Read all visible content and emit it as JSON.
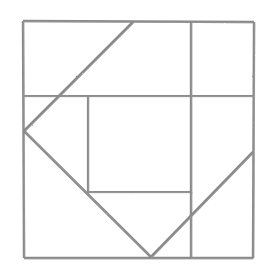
{
  "figure": {
    "medium": "pencil sketch",
    "canvas": {
      "width": 266,
      "height": 273,
      "background_color": "#ffffff"
    },
    "style": {
      "stroke_color": "#8a8a8a",
      "stroke_color_light": "#9d9d9d",
      "stroke_width": 2.4,
      "stroke_width_thin": 2.0
    },
    "elements": [
      {
        "name": "outer-frame-top-edge",
        "kind": "segment",
        "x1": 23,
        "y1": 21,
        "x2": 254,
        "y2": 22,
        "width": 2.4,
        "color": "#8a8a8a"
      },
      {
        "name": "outer-frame-right-edge",
        "kind": "segment",
        "x1": 254,
        "y1": 22,
        "x2": 253,
        "y2": 258,
        "width": 2.4,
        "color": "#8a8a8a"
      },
      {
        "name": "outer-frame-bottom-edge",
        "kind": "segment",
        "x1": 253,
        "y1": 258,
        "x2": 24,
        "y2": 258,
        "width": 2.4,
        "color": "#8a8a8a"
      },
      {
        "name": "outer-frame-left-edge",
        "kind": "segment",
        "x1": 24,
        "y1": 258,
        "x2": 23,
        "y2": 21,
        "width": 2.4,
        "color": "#8a8a8a"
      },
      {
        "name": "upper-horizontal-divider",
        "kind": "segment",
        "x1": 23,
        "y1": 96,
        "x2": 254,
        "y2": 96,
        "width": 2.2,
        "color": "#8d8d8d"
      },
      {
        "name": "inner-square-bottom-edge",
        "kind": "segment",
        "x1": 88,
        "y1": 192,
        "x2": 192,
        "y2": 192,
        "width": 2.2,
        "color": "#8d8d8d"
      },
      {
        "name": "right-vertical-divider",
        "kind": "segment",
        "x1": 191,
        "y1": 22,
        "x2": 191,
        "y2": 257,
        "width": 2.4,
        "color": "#8a8a8a"
      },
      {
        "name": "inner-square-left-edge",
        "kind": "segment",
        "x1": 88,
        "y1": 96,
        "x2": 88,
        "y2": 193,
        "width": 2.2,
        "color": "#8d8d8d"
      },
      {
        "name": "diagonal-top-to-left-vertex",
        "kind": "segment",
        "x1": 133,
        "y1": 22,
        "x2": 24,
        "y2": 131,
        "width": 2.6,
        "color": "#878787"
      },
      {
        "name": "diagonal-left-vertex-to-bottom-vertex",
        "kind": "segment",
        "x1": 24,
        "y1": 131,
        "x2": 151,
        "y2": 257,
        "width": 2.6,
        "color": "#878787"
      },
      {
        "name": "diagonal-bottom-vertex-to-right-edge",
        "kind": "segment",
        "x1": 151,
        "y1": 257,
        "x2": 253,
        "y2": 152,
        "width": 2.6,
        "color": "#878787"
      }
    ],
    "vertices": [
      {
        "name": "frame-top-left",
        "x": 23,
        "y": 21
      },
      {
        "name": "frame-top-right",
        "x": 254,
        "y": 22
      },
      {
        "name": "frame-bottom-right",
        "x": 253,
        "y": 258
      },
      {
        "name": "frame-bottom-left",
        "x": 24,
        "y": 258
      },
      {
        "name": "diagonal-apex-top",
        "x": 133,
        "y": 22
      },
      {
        "name": "diagonal-apex-left",
        "x": 24,
        "y": 131
      },
      {
        "name": "diagonal-apex-bottom",
        "x": 151,
        "y": 257
      },
      {
        "name": "diagonal-apex-right",
        "x": 253,
        "y": 152
      },
      {
        "name": "inner-square-top-left",
        "x": 88,
        "y": 96
      },
      {
        "name": "inner-square-bottom-left",
        "x": 88,
        "y": 192
      },
      {
        "name": "inner-square-bottom-right",
        "x": 192,
        "y": 192
      }
    ]
  }
}
